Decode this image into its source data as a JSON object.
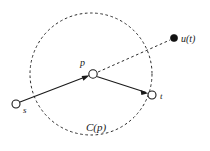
{
  "figure": {
    "width": 210,
    "height": 151,
    "background_color": "#ffffff",
    "ink_color": "#1a1a1a"
  },
  "nodes": [
    {
      "id": "s",
      "label": "s",
      "kind": "open-circle",
      "x": 16,
      "y": 104,
      "radius": 4,
      "label_x": 23,
      "label_y": 113
    },
    {
      "id": "p",
      "label": "p",
      "kind": "open-circle",
      "x": 93,
      "y": 74,
      "radius": 4.2,
      "label_x": 80,
      "label_y": 66
    },
    {
      "id": "t",
      "label": "t",
      "kind": "open-circle",
      "x": 152,
      "y": 95,
      "radius": 4,
      "label_x": 160,
      "label_y": 99
    },
    {
      "id": "u",
      "label": "u(t)",
      "kind": "filled-dot",
      "x": 174,
      "y": 38,
      "radius": 3.6,
      "label_x": 181,
      "label_y": 42
    }
  ],
  "edges": [
    {
      "id": "s-to-p",
      "from": "s",
      "to": "p",
      "style": "solid",
      "arrow": true,
      "x1": 20,
      "y1": 102,
      "x2": 88,
      "y2": 76
    },
    {
      "id": "p-to-t",
      "from": "p",
      "to": "t",
      "style": "solid",
      "arrow": true,
      "x1": 98,
      "y1": 77,
      "x2": 148,
      "y2": 93
    },
    {
      "id": "p-to-u",
      "from": "p",
      "to": "u",
      "style": "dashed",
      "arrow": false,
      "x1": 98,
      "y1": 72,
      "x2": 170,
      "y2": 40
    }
  ],
  "region": {
    "id": "C(p)",
    "label": "C(p)",
    "style": "dashed-circle",
    "center_x": 91,
    "center_y": 74,
    "radius": 61,
    "label_x": 86,
    "label_y": 131
  }
}
